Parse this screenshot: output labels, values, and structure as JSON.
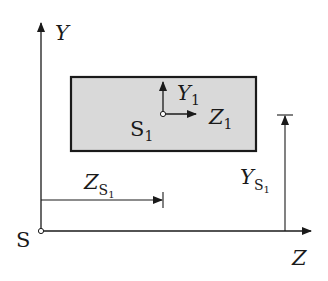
{
  "diagram": {
    "colors": {
      "stroke": "#1a1a1a",
      "rect_fill": "#d9d9d9",
      "background": "#ffffff"
    },
    "global_frame": {
      "origin_label": "S",
      "y_axis_label": "Y",
      "z_axis_label": "Z"
    },
    "local_frame": {
      "origin_label": "S",
      "origin_subscript": "1",
      "y_axis_label": "Y",
      "y_axis_subscript": "1",
      "z_axis_label": "Z",
      "z_axis_subscript": "1"
    },
    "dimensions": {
      "z_offset_label": "Z",
      "z_offset_subscript": "S",
      "z_offset_subsubscript": "1",
      "y_offset_label": "Y",
      "y_offset_subscript": "S",
      "y_offset_subsubscript": "1"
    }
  }
}
